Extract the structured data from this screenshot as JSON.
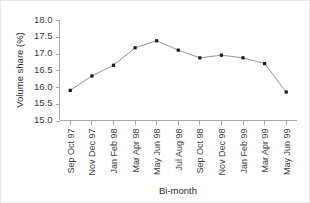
{
  "chart_data": {
    "type": "line",
    "title": "",
    "subtitle": "",
    "xlabel": "Bi-month",
    "ylabel": "Volume share (%)",
    "categories": [
      "Sep Oct 97",
      "Nov Dec 97",
      "Jan Feb 98",
      "Mar Apr 98",
      "May Jun 98",
      "Jul Aug 98",
      "Sep Oct 98",
      "Nov Dec 98",
      "Jan Feb 99",
      "Mar Apr 99",
      "May Jun 99"
    ],
    "values": [
      15.9,
      16.33,
      16.65,
      17.17,
      17.38,
      17.1,
      16.87,
      16.95,
      16.87,
      16.7,
      15.85
    ],
    "ylim": [
      15.0,
      18.0
    ],
    "ytick_labels": [
      "15.0",
      "15.5",
      "16.0",
      "16.5",
      "17.0",
      "17.5",
      "18.0"
    ],
    "ytick_values": [
      15.0,
      15.5,
      16.0,
      16.5,
      17.0,
      17.5,
      18.0
    ],
    "grid": false,
    "legend": false,
    "legend_position": "none",
    "marker": "square",
    "colors": {
      "line": "#8a8a8a",
      "marker": "#1a1a1a",
      "axis": "#a8a8a8",
      "text": "#3b3b3b",
      "background": "#ffffff",
      "border": "#e8e8e8"
    }
  }
}
